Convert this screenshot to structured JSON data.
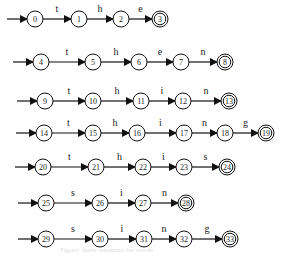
{
  "diagram": {
    "type": "finite-automata",
    "automata": [
      {
        "word": "the",
        "states": [
          0,
          1,
          2,
          3
        ],
        "labels": [
          "t",
          "h",
          "e"
        ],
        "y": 19,
        "xs": [
          35,
          79,
          121,
          160
        ]
      },
      {
        "word": "then",
        "states": [
          4,
          5,
          6,
          7,
          8
        ],
        "labels": [
          "t",
          "h",
          "e",
          "n"
        ],
        "y": 62,
        "xs": [
          41,
          93,
          139,
          181,
          225
        ]
      },
      {
        "word": "thin",
        "states": [
          9,
          10,
          11,
          12,
          13
        ],
        "labels": [
          "t",
          "h",
          "i",
          "n"
        ],
        "y": 101,
        "xs": [
          45,
          93,
          141,
          183,
          229
        ]
      },
      {
        "word": "thing",
        "states": [
          14,
          15,
          16,
          17,
          18,
          19
        ],
        "labels": [
          "t",
          "h",
          "i",
          "n",
          "g"
        ],
        "y": 133,
        "xs": [
          44,
          93,
          137,
          184,
          225,
          266
        ]
      },
      {
        "word": "this",
        "states": [
          20,
          21,
          22,
          23,
          24
        ],
        "labels": [
          "t",
          "h",
          "i",
          "s"
        ],
        "y": 167,
        "xs": [
          43,
          96,
          143,
          184,
          227
        ]
      },
      {
        "word": "sin",
        "states": [
          25,
          26,
          27,
          28
        ],
        "labels": [
          "s",
          "i",
          "n"
        ],
        "y": 203,
        "xs": [
          46,
          100,
          143,
          186
        ]
      },
      {
        "word": "sing",
        "states": [
          29,
          30,
          31,
          32,
          33
        ],
        "labels": [
          "s",
          "i",
          "n",
          "g"
        ],
        "y": 239,
        "xs": [
          46,
          100,
          144,
          184,
          230
        ]
      }
    ],
    "caption": "Figure: finite automata for words"
  }
}
